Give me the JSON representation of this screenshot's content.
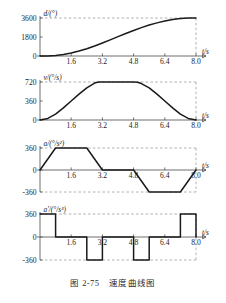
{
  "figure": {
    "caption": "图 2-75　速度曲线图",
    "colors": {
      "curve": "#1a1a1a",
      "axis": "#4a4a4a",
      "guide": "#8a8a8a",
      "background": "#ffffff"
    }
  },
  "chart_data": [
    {
      "type": "line",
      "name": "position",
      "title": "",
      "ylabel": "d/(°)",
      "xlabel": "t/s",
      "ytick_labels": [
        "0",
        "1800",
        "3600"
      ],
      "yticks": [
        0,
        1800,
        3600
      ],
      "xtick_labels": [
        "1.6",
        "3.2",
        "4.8",
        "6.4",
        "8.0"
      ],
      "xticks": [
        1.6,
        3.2,
        4.8,
        6.4,
        8.0
      ],
      "xlim": [
        0,
        8.6
      ],
      "ylim": [
        0,
        3600
      ],
      "grid": false,
      "guides": [
        "y=3600",
        "x=8.0"
      ],
      "x": [
        0,
        0.4,
        0.8,
        1.2,
        1.6,
        2.0,
        2.4,
        2.8,
        3.2,
        3.6,
        4.0,
        4.4,
        4.8,
        5.2,
        5.6,
        6.0,
        6.4,
        6.8,
        7.2,
        7.6,
        8.0
      ],
      "y": [
        0,
        8,
        55,
        150,
        290,
        470,
        690,
        945,
        1230,
        1530,
        1830,
        2130,
        2420,
        2690,
        2930,
        3140,
        3310,
        3450,
        3545,
        3590,
        3600
      ]
    },
    {
      "type": "line",
      "name": "velocity",
      "title": "",
      "ylabel": "v/(°/s)",
      "xlabel": "t/s",
      "ytick_labels": [
        "0",
        "360",
        "720"
      ],
      "yticks": [
        0,
        360,
        720
      ],
      "xtick_labels": [
        "1.6",
        "3.2",
        "4.8",
        "6.4",
        "8.0"
      ],
      "xticks": [
        1.6,
        3.2,
        4.8,
        6.4,
        8.0
      ],
      "xlim": [
        0,
        8.6
      ],
      "ylim": [
        0,
        720
      ],
      "grid": false,
      "guides": [
        "y=720",
        "x=8.0"
      ],
      "x": [
        0,
        0.4,
        0.8,
        1.2,
        1.6,
        2.0,
        2.4,
        2.8,
        3.0,
        3.2,
        4.0,
        4.8,
        5.0,
        5.2,
        5.6,
        6.0,
        6.4,
        6.8,
        7.2,
        7.6,
        8.0
      ],
      "y": [
        0,
        30,
        110,
        230,
        360,
        490,
        610,
        700,
        720,
        720,
        720,
        720,
        715,
        690,
        610,
        490,
        360,
        230,
        110,
        30,
        0
      ]
    },
    {
      "type": "line",
      "name": "acceleration",
      "title": "",
      "ylabel": "a/(°/s²)",
      "xlabel": "t/s",
      "ytick_labels": [
        "-360",
        "0",
        "360"
      ],
      "yticks": [
        -360,
        0,
        360
      ],
      "xtick_labels": [
        "1.6",
        "3.2",
        "4.8",
        "6.4",
        "8.0"
      ],
      "xticks": [
        1.6,
        3.2,
        4.8,
        6.4,
        8.0
      ],
      "xlim": [
        0,
        8.6
      ],
      "ylim": [
        -360,
        360
      ],
      "grid": false,
      "guides": [
        "y=360",
        "y=-360",
        "x=8.0"
      ],
      "x": [
        0,
        0.8,
        2.4,
        3.2,
        4.8,
        5.6,
        7.2,
        8.0
      ],
      "y": [
        0,
        360,
        360,
        0,
        0,
        -360,
        -360,
        0
      ]
    },
    {
      "type": "line",
      "name": "jerk",
      "title": "",
      "ylabel": "a'/(°/s³)",
      "xlabel": "t/s",
      "ytick_labels": [
        "-360",
        "0",
        "360"
      ],
      "yticks": [
        -360,
        0,
        360
      ],
      "xtick_labels": [
        "1.6",
        "3.2",
        "4.8",
        "6.4",
        "8.0"
      ],
      "xticks": [
        1.6,
        3.2,
        4.8,
        6.4,
        8.0
      ],
      "xlim": [
        0,
        8.6
      ],
      "ylim": [
        -360,
        360
      ],
      "grid": false,
      "guides": [
        "y=360",
        "y=-360",
        "x=8.0"
      ],
      "x": [
        0,
        0.8,
        0.8,
        2.4,
        2.4,
        3.2,
        3.2,
        4.8,
        4.8,
        5.6,
        5.6,
        7.2,
        7.2,
        8.0,
        8.0
      ],
      "y": [
        360,
        360,
        0,
        0,
        -360,
        -360,
        0,
        0,
        -360,
        -360,
        0,
        0,
        360,
        360,
        0
      ]
    }
  ]
}
